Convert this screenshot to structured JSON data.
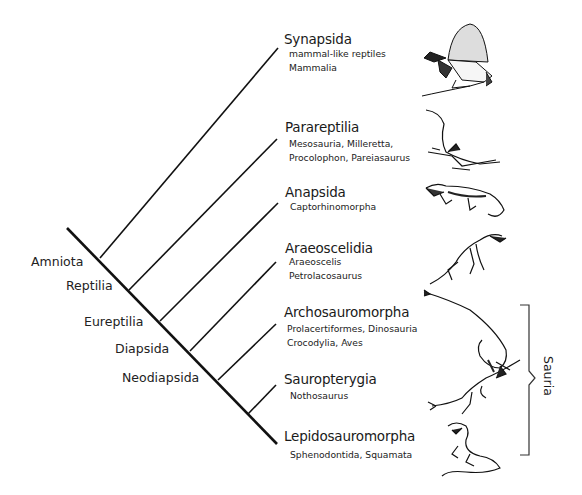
{
  "diagram": {
    "type": "cladogram",
    "internal_nodes": [
      {
        "label": "Amniota"
      },
      {
        "label": "Reptilia"
      },
      {
        "label": "Eureptilia"
      },
      {
        "label": "Diapsida"
      },
      {
        "label": "Neodiapsida"
      }
    ],
    "clades": [
      {
        "title": "Synapsida",
        "members": [
          "mammal-like reptiles",
          "Mammalia"
        ],
        "illustration": "dimetrodon-sail-back-icon"
      },
      {
        "title": "Parareptilia",
        "members": [
          "Mesosauria, Milleretta,",
          "Procolophon, Pareiasaurus"
        ],
        "illustration": "mesosaur-icon"
      },
      {
        "title": "Anapsida",
        "members": [
          "Captorhinomorpha"
        ],
        "illustration": "captorhinid-lizard-icon"
      },
      {
        "title": "Araeoscelidia",
        "members": [
          "Araeoscelis",
          "Petrolacosaurus"
        ],
        "illustration": "araeoscelis-icon"
      },
      {
        "title": "Archosauromorpha",
        "members": [
          "Prolacertiformes, Dinosauria",
          "Crocodylia, Aves"
        ],
        "illustration": "tanystropheus-long-neck-icon"
      },
      {
        "title": "Sauropterygia",
        "members": [
          "Nothosaurus"
        ],
        "illustration": "nothosaur-icon"
      },
      {
        "title": "Lepidosauromorpha",
        "members": [
          "Sphenodontida, Squamata"
        ],
        "illustration": "tuatara-lizard-icon"
      }
    ],
    "bracket": {
      "label": "Sauria",
      "spans": [
        "Archosauromorpha",
        "Sauropterygia",
        "Lepidosauromorpha"
      ]
    },
    "colors": {
      "line": "#111111",
      "text": "#1a1a1a",
      "background": "#ffffff"
    }
  }
}
